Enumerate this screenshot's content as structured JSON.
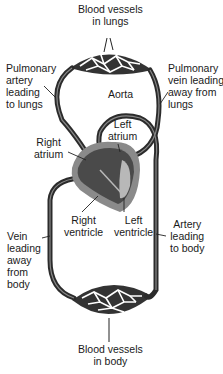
{
  "labels": {
    "lung_vessels": [
      "Blood vessels",
      "in lungs"
    ],
    "pulmonary_artery": [
      "Pulmonary",
      "artery",
      "leading",
      "to lungs"
    ],
    "pulmonary_vein": [
      "Pulmonary",
      "vein leading",
      "away from",
      "lungs"
    ],
    "aorta": [
      "Aorta"
    ],
    "left_atrium": [
      "Left",
      "atrium"
    ],
    "right_atrium": [
      "Right",
      "atrium"
    ],
    "right_ventricle": [
      "Right",
      "ventricle"
    ],
    "left_ventricle": [
      "Left",
      "ventricle"
    ],
    "vein_from_body": [
      "Vein",
      "leading",
      "away",
      "from",
      "body"
    ],
    "artery_to_body": [
      "Artery",
      "leading",
      "to body"
    ],
    "body_vessels": [
      "Blood vessels",
      "in body"
    ]
  },
  "colors": {
    "vessel": "#2b2b2b",
    "heart_outer": "#8a8a8a",
    "heart_inner": "#4a4a4a",
    "heart_light": "#b8b8b8"
  }
}
